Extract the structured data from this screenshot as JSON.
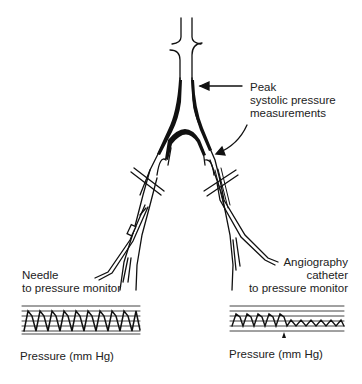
{
  "diagram": {
    "labels": {
      "peak_line1": "Peak",
      "peak_line2": "systolic pressure",
      "peak_line3": "measurements",
      "needle_line1": "Needle",
      "needle_line2": "to pressure monitor",
      "catheter_line1": "Angiography",
      "catheter_line2": "catheter",
      "catheter_line3": "to pressure monitor",
      "left_trace_caption": "Pressure (mm Hg)",
      "right_trace_caption": "Pressure (mm Hg)"
    },
    "elements": {
      "vessel": "aorto-iliac bifurcation with stenosis",
      "left_instrument": "needle",
      "right_instrument": "angiography catheter"
    },
    "traces": {
      "left": {
        "waveform": "uniform peaked",
        "cycles": 11
      },
      "right": {
        "waveform": "damped after marker",
        "cycles_full": 5,
        "cycles_damped": 7,
        "marker": "arrow"
      }
    },
    "colors": {
      "ink": "#111111",
      "background": "#ffffff"
    }
  }
}
